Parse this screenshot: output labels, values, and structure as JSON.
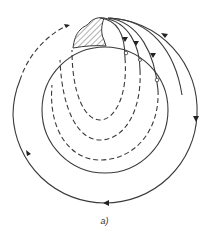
{
  "figure": {
    "caption": "a)",
    "elements": {
      "outer_loop": "solid closed loop with arrows, dashed at upper-left",
      "inner_boundary": "solid circle",
      "inner_loops": "dashed nested loops",
      "feature": "hatched region at top"
    },
    "colors": {
      "ink": "#3a3a3a",
      "background": "#ffffff"
    }
  }
}
